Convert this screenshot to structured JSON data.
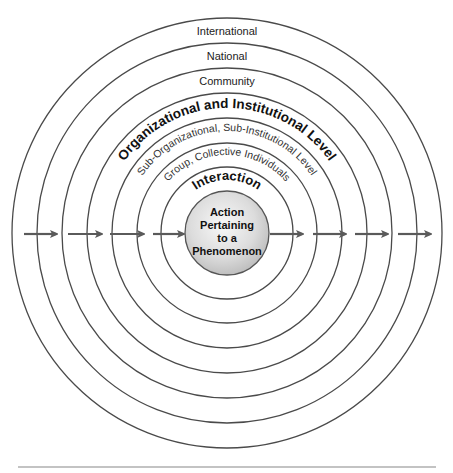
{
  "diagram": {
    "type": "concentric-levels",
    "center": {
      "x": 227,
      "y": 233
    },
    "rings": [
      {
        "level": "International",
        "radius": 215,
        "label_style": "flat"
      },
      {
        "level": "National",
        "radius": 190,
        "label_style": "flat"
      },
      {
        "level": "Community",
        "radius": 165,
        "label_style": "flat"
      },
      {
        "level": "Organizational and Institutional Level",
        "radius": 140,
        "label_style": "curved-bold"
      },
      {
        "level": "Sub-Organizational, Sub-Institutional Level",
        "radius": 115,
        "label_style": "curved"
      },
      {
        "level": "Group, Collective Individuals",
        "radius": 90,
        "label_style": "curved"
      },
      {
        "level": "Interaction",
        "radius": 66,
        "label_style": "curved-bold"
      }
    ],
    "labels": {
      "international": "International",
      "national": "National",
      "community": "Community",
      "organizational": "Organizational and Institutional Level",
      "sub_organizational": "Sub-Organizational, Sub-Institutional Level",
      "group": "Group, Collective Individuals",
      "interaction": "Interaction"
    },
    "core": {
      "radius": 42,
      "lines": [
        "Action",
        "Pertaining",
        "to a",
        "Phenomenon"
      ]
    },
    "arrows": {
      "direction": "left-to-right",
      "count": 8,
      "color": "#5a5a5a"
    },
    "colors": {
      "ring_stroke": "#4a4a4a",
      "core_fill_light": "#f6f6f6",
      "core_fill_dark": "#bdbdbd"
    }
  }
}
